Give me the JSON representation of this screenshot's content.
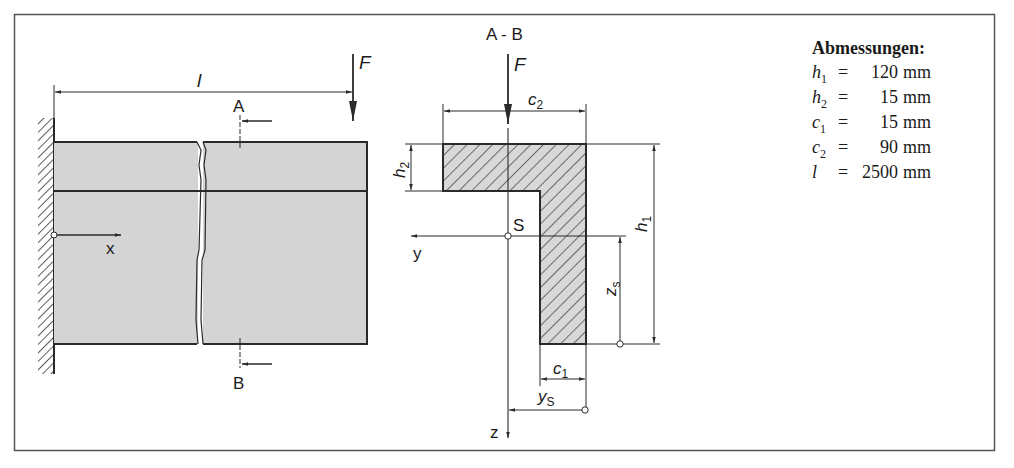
{
  "figure": {
    "frame": {
      "stroke": "#555555"
    },
    "colors": {
      "beam_fill": "#d4d4d4",
      "line": "#2a2a2a",
      "hatch_fill": "#d8d8d8"
    },
    "side_view": {
      "length_label": "l",
      "force_label": "F",
      "section_top_label": "A",
      "section_bottom_label": "B",
      "axis_x_label": "x"
    },
    "cross_section": {
      "title": "A - B",
      "force_label": "F",
      "c2_label": "c",
      "c2_sub": "2",
      "c1_label": "c",
      "c1_sub": "1",
      "h1_label": "h",
      "h1_sub": "1",
      "h2_label": "h",
      "h2_sub": "2",
      "zs_label": "z",
      "zs_sub": "s",
      "ys_label": "y",
      "ys_sub": "S",
      "centroid_label": "S",
      "axis_y_label": "y",
      "axis_z_label": "z"
    }
  },
  "dimensions": {
    "title": "Abmessungen:",
    "rows": [
      {
        "symbol": "h",
        "sub": "1",
        "eq": "=",
        "value": "120",
        "unit": "mm"
      },
      {
        "symbol": "h",
        "sub": "2",
        "eq": "=",
        "value": "15",
        "unit": "mm"
      },
      {
        "symbol": "c",
        "sub": "1",
        "eq": "=",
        "value": "15",
        "unit": "mm"
      },
      {
        "symbol": "c",
        "sub": "2",
        "eq": "=",
        "value": "90",
        "unit": "mm"
      },
      {
        "symbol": "l",
        "sub": "",
        "eq": "=",
        "value": "2500",
        "unit": "mm"
      }
    ]
  }
}
